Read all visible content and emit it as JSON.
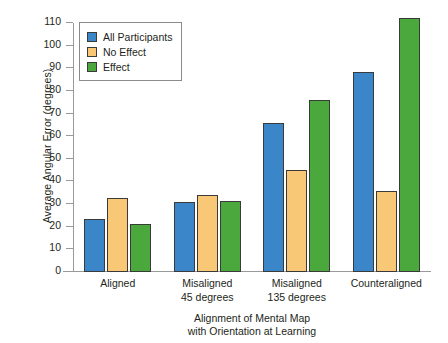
{
  "chart_data": {
    "type": "bar",
    "title": "",
    "subtitle": "",
    "xlabel": "Alignment of Mental Map with Orientation at Learning",
    "xlabel_line1": "Alignment of Mental Map",
    "xlabel_line2": "with Orientation at Learning",
    "ylabel": "Average Angular Error (degrees)",
    "categories": [
      "Aligned",
      "Misaligned 45 degrees",
      "Misaligned 135 degrees",
      "Counteraligned"
    ],
    "category_lines": [
      [
        "Aligned",
        ""
      ],
      [
        "Misaligned",
        "45 degrees"
      ],
      [
        "Misaligned",
        "135 degrees"
      ],
      [
        "Counteraligned",
        ""
      ]
    ],
    "series": [
      {
        "name": "All Participants",
        "color": "#3a86c8",
        "values": [
          23.5,
          31,
          66,
          88.5
        ]
      },
      {
        "name": "No Effect",
        "color": "#f9c876",
        "values": [
          32.5,
          34,
          45,
          36
        ]
      },
      {
        "name": "Effect",
        "color": "#4aa83c",
        "values": [
          21,
          31.5,
          76,
          112
        ]
      }
    ],
    "ylim": [
      0,
      110
    ],
    "ytick_step": 10,
    "yticks": [
      0,
      10,
      20,
      30,
      40,
      50,
      60,
      70,
      80,
      90,
      100,
      110
    ],
    "ytick_labels": [
      "0",
      "10",
      "20",
      "30",
      "40",
      "50",
      "60",
      "70",
      "80",
      "90",
      "100",
      "110"
    ],
    "grid": false,
    "legend_position": "top-left",
    "axis_color": "#9a9a9a",
    "bar_edge_color": "#3a3a3a",
    "text_color": "#231f20"
  }
}
